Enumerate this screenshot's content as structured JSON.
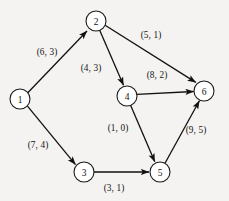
{
  "figure": {
    "background_color": "#f4f3f1",
    "node_fill": "#ffffff",
    "node_stroke": "#1a1a1a",
    "edge_color": "#111111",
    "width": 229,
    "height": 201
  },
  "graph": {
    "type": "directed",
    "node_radius": 10,
    "nodes": [
      {
        "id": "1",
        "label": "1",
        "x": 20,
        "y": 99
      },
      {
        "id": "2",
        "label": "2",
        "x": 96,
        "y": 21
      },
      {
        "id": "3",
        "label": "3",
        "x": 84,
        "y": 172
      },
      {
        "id": "4",
        "label": "4",
        "x": 127,
        "y": 96
      },
      {
        "id": "5",
        "label": "5",
        "x": 160,
        "y": 172
      },
      {
        "id": "6",
        "label": "6",
        "x": 204,
        "y": 91
      }
    ],
    "edges": [
      {
        "from": "1",
        "to": "2",
        "label": "(6, 3)",
        "label_x": 47,
        "label_y": 52,
        "weights": [
          6,
          3
        ]
      },
      {
        "from": "1",
        "to": "3",
        "label": "(7, 4)",
        "label_x": 38,
        "label_y": 145,
        "weights": [
          7,
          4
        ]
      },
      {
        "from": "2",
        "to": "6",
        "label": "(5, 1)",
        "label_x": 151,
        "label_y": 35,
        "weights": [
          5,
          1
        ]
      },
      {
        "from": "2",
        "to": "4",
        "label": "(4, 3)",
        "label_x": 91,
        "label_y": 68,
        "weights": [
          4,
          3
        ]
      },
      {
        "from": "4",
        "to": "6",
        "label": "(8, 2)",
        "label_x": 157,
        "label_y": 75,
        "weights": [
          8,
          2
        ]
      },
      {
        "from": "4",
        "to": "5",
        "label": "(1, 0)",
        "label_x": 118,
        "label_y": 128,
        "weights": [
          1,
          0
        ]
      },
      {
        "from": "3",
        "to": "5",
        "label": "(3, 1)",
        "label_x": 114,
        "label_y": 188,
        "weights": [
          3,
          1
        ]
      },
      {
        "from": "5",
        "to": "6",
        "label": "(9, 5)",
        "label_x": 196,
        "label_y": 130,
        "weights": [
          9,
          5
        ]
      }
    ]
  }
}
